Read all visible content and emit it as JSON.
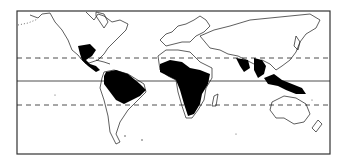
{
  "map": {
    "type": "world-outline",
    "projection": "equirectangular",
    "colors": {
      "background": "#ffffff",
      "coast": "#1a1a1a",
      "shaded": "#000000",
      "frame": "#333333"
    },
    "lines": [
      {
        "name": "tropic-of-cancer",
        "style": "dashed"
      },
      {
        "name": "equator",
        "style": "solid"
      },
      {
        "name": "tropic-of-capricorn",
        "style": "dashed"
      }
    ],
    "shaded_regions": [
      "Central America / southern Mexico",
      "Amazon basin / northern South America",
      "West and Central Africa to East Africa",
      "South Asia / Southeast Asia",
      "Indonesia / New Guinea"
    ]
  }
}
